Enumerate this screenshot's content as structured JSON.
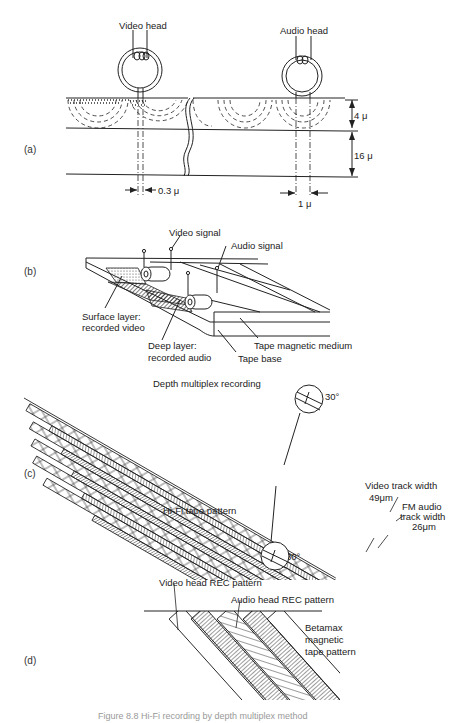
{
  "figure": {
    "panels": [
      {
        "id": "a",
        "label": "(a)",
        "annotations": {
          "video_head": "Video head",
          "audio_head": "Audio head",
          "layer_thickness_top": "4 μ",
          "layer_thickness_bottom": "16 μ",
          "video_gap": "0.3 μ",
          "audio_gap": "1 μ"
        }
      },
      {
        "id": "b",
        "label": "(b)",
        "title": "Depth multiplex recording",
        "annotations": {
          "video_signal": "Video signal",
          "audio_signal": "Audio signal",
          "surface_layer": "Surface layer:",
          "surface_layer_2": "recorded video",
          "deep_layer": "Deep layer:",
          "deep_layer_2": "recorded audio",
          "tape_magnetic_medium": "Tape magnetic medium",
          "tape_base": "Tape base"
        }
      },
      {
        "id": "c",
        "label": "(c)",
        "title": "Hi-Fi tape pattern",
        "annotations": {
          "angle_top": "30°",
          "angle_bottom": "30°",
          "video_track_width": "Video track width",
          "video_track_width_value": "49μm",
          "fm_audio": "FM audio",
          "fm_audio_track_width": "track width",
          "fm_audio_track_width_value": "26μm"
        }
      },
      {
        "id": "d",
        "label": "(d)",
        "annotations": {
          "video_head_rec": "Video head REC pattern",
          "audio_head_rec": "Audio head REC pattern",
          "betamax_1": "Betamax",
          "betamax_2": "magnetic",
          "betamax_3": "tape pattern"
        }
      }
    ],
    "caption": "Figure 8.8   Hi-Fi recording by depth multiplex method"
  }
}
